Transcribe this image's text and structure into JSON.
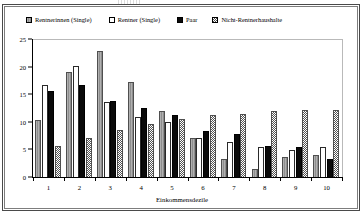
{
  "chart_data": {
    "type": "bar",
    "title": "",
    "xlabel": "Einkommensdezile",
    "ylabel": "",
    "categories": [
      "1",
      "2",
      "3",
      "4",
      "5",
      "6",
      "7",
      "8",
      "9",
      "10"
    ],
    "ylim": [
      0,
      25
    ],
    "yticks": [
      0,
      5,
      10,
      15,
      20,
      25
    ],
    "grid": false,
    "legend_position": "top",
    "series": [
      {
        "name": "Rentnerinnen (Single)",
        "swatch": "grey-hatch-swatch",
        "values": [
          10.3,
          19.0,
          22.9,
          17.2,
          12.0,
          7.0,
          3.2,
          1.4,
          3.6,
          4.0
        ]
      },
      {
        "name": "Rentner (Single)",
        "swatch": "white-swatch",
        "values": [
          16.7,
          20.1,
          13.6,
          10.8,
          9.9,
          7.0,
          6.3,
          5.5,
          4.9,
          5.5
        ]
      },
      {
        "name": "Paar",
        "swatch": "black-swatch",
        "values": [
          15.6,
          16.6,
          13.7,
          12.5,
          11.3,
          8.4,
          7.8,
          5.7,
          5.4,
          3.2
        ]
      },
      {
        "name": "Nicht-Rentnerhaushalte",
        "swatch": "checker-swatch",
        "values": [
          5.6,
          7.1,
          8.5,
          9.6,
          10.5,
          11.2,
          11.4,
          11.9,
          12.1,
          12.2
        ]
      }
    ]
  }
}
